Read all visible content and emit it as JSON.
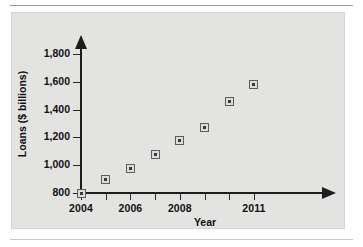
{
  "chart_data": {
    "type": "scatter",
    "title": "",
    "xlabel": "Year",
    "ylabel": "Loans ($ billions)",
    "x": [
      2004,
      2005,
      2006,
      2007,
      2008,
      2009,
      2010,
      2011
    ],
    "values": [
      800,
      895,
      975,
      1080,
      1180,
      1270,
      1460,
      1580
    ],
    "categories": [
      "2004",
      "2005",
      "2006",
      "2007",
      "2008",
      "2009",
      "2010",
      "2011"
    ],
    "xlim": [
      2004,
      2011
    ],
    "ylim": [
      800,
      1900
    ],
    "yticks": [
      800,
      1000,
      1200,
      1400,
      1600,
      1800
    ],
    "ytick_labels": [
      "800",
      "1,000",
      "1,200",
      "1,400",
      "1,600",
      "1,800"
    ],
    "xticks": [
      2004,
      2005,
      2006,
      2007,
      2008,
      2009,
      2010,
      2011
    ],
    "xtick_labels_shown": [
      "2004",
      "",
      "2006",
      "",
      "2008",
      "",
      "",
      "2011"
    ],
    "grid": false,
    "legend": null,
    "marker_style": "square-with-center-dot",
    "axis_arrows": true,
    "colors": {
      "panel_background": "#e3e3e1",
      "axis": "#1d1d1d",
      "marker_edge": "#5d5d5d",
      "marker_fill": "#dcdcda",
      "text": "#111111"
    }
  },
  "axis": {
    "y_title": "Loans ($ billions)",
    "x_title": "Year"
  },
  "y_labels": [
    {
      "text": "1,800",
      "value": 1800
    },
    {
      "text": "1,600",
      "value": 1600
    },
    {
      "text": "1,400",
      "value": 1400
    },
    {
      "text": "1,200",
      "value": 1200
    },
    {
      "text": "1,000",
      "value": 1000
    },
    {
      "text": "800",
      "value": 800
    }
  ],
  "x_labels": [
    {
      "text": "2004",
      "value": 2004
    },
    {
      "text": "2006",
      "value": 2006
    },
    {
      "text": "2008",
      "value": 2008
    },
    {
      "text": "2011",
      "value": 2011
    }
  ]
}
